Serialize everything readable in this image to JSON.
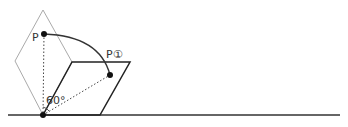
{
  "diagram": {
    "labels": {
      "point_p": "P",
      "point_p1": "P①",
      "angle": "60°"
    },
    "colors": {
      "ground": "#333333",
      "parallelogram": "#222222",
      "rhombus": "#aaaaaa",
      "arc": "#333333",
      "dotted": "#444444",
      "point": "#111111"
    },
    "points": {
      "origin": [
        43,
        115
      ],
      "p": [
        44,
        34
      ],
      "p1": [
        110,
        75
      ]
    }
  }
}
